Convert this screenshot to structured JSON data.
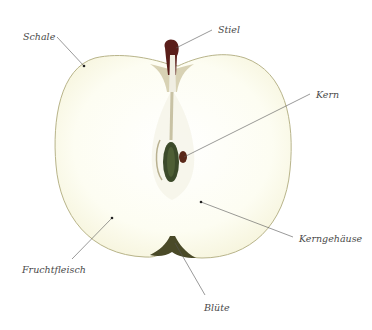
{
  "labels": {
    "schale": "Schale",
    "stiel": "Stiel",
    "kern": "Kern",
    "kerngehaeuse": "Kerngehäuse",
    "fruchtfleisch": "Fruchtfleisch",
    "bluete": "Blüte"
  },
  "colors": {
    "background": "#ffffff",
    "flesh": "#fdfdf1",
    "skin_outline": "#b8b48a",
    "stem": "#5a1e1a",
    "seed": "#3c4a2a",
    "calyx": "#4a4a28",
    "leader_line": "#555555",
    "label_text": "#4a4a4a"
  }
}
